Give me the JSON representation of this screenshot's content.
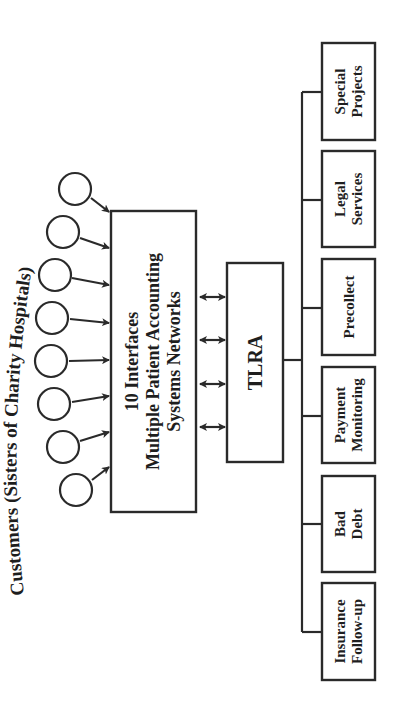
{
  "orientation": "rotated-90-ccw",
  "title": "Customers (Sisters of Charity Hospitals)",
  "customers": {
    "count": 8,
    "icon": "circle-node"
  },
  "interfaces_box": {
    "line1": "10 Interfaces",
    "line2": "Multiple Patient Accounting",
    "line3": "Systems Networks"
  },
  "bidirectional_links": 4,
  "center_box": {
    "label": "TLRA"
  },
  "services": [
    {
      "line1": "Insurance",
      "line2": "Follow-up"
    },
    {
      "line1": "Bad",
      "line2": "Debt"
    },
    {
      "line1": "Payment",
      "line2": "Monitoring"
    },
    {
      "line1": "Precollect",
      "line2": ""
    },
    {
      "line1": "Legal",
      "line2": "Services"
    },
    {
      "line1": "Special",
      "line2": "Projects"
    }
  ],
  "colors": {
    "stroke": "#2a2a2a",
    "text": "#1e1e1e",
    "background": "#ffffff"
  }
}
